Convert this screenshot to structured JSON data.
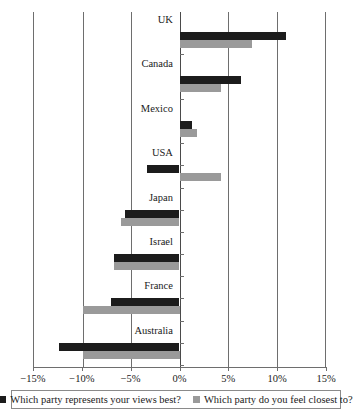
{
  "chart_data": {
    "type": "bar",
    "orientation": "horizontal",
    "title": "",
    "xlabel": "",
    "ylabel": "",
    "xlim": [
      -15,
      15
    ],
    "xticks": [
      -15,
      -10,
      -5,
      0,
      5,
      10,
      15
    ],
    "xticklabels": [
      "−15%",
      "−10%",
      "−5%",
      "0%",
      "5%",
      "10%",
      "15%"
    ],
    "grid": true,
    "legend_position": "bottom",
    "categories": [
      "UK",
      "Canada",
      "Mexico",
      "USA",
      "Japan",
      "Israel",
      "France",
      "Australia"
    ],
    "series": [
      {
        "name": "Which party represents your views best?",
        "color": "#1c1c1c",
        "values": [
          11.0,
          6.3,
          1.3,
          -3.4,
          -5.6,
          -6.8,
          -7.1,
          -12.4
        ]
      },
      {
        "name": "Which party do you feel closest to?",
        "color": "#9a9a9a",
        "values": [
          7.5,
          4.3,
          1.8,
          4.3,
          -6.0,
          -6.8,
          -10.0,
          -10.0
        ]
      }
    ]
  },
  "legend": {
    "items": [
      {
        "label": "Which party represents your views best?",
        "swatch": "dark-swatch"
      },
      {
        "label": "Which party do you feel closest to?",
        "swatch": "light-swatch"
      }
    ]
  }
}
